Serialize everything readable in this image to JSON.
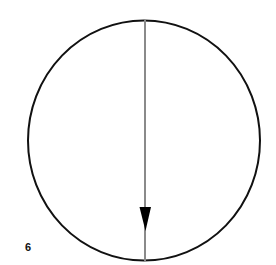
{
  "diagram": {
    "label": "6",
    "circle": {
      "cx": 144,
      "cy": 140.5,
      "rx": 116,
      "ry": 120,
      "stroke": "#111111",
      "stroke_width": 2
    },
    "vector": {
      "x": 145,
      "y_start": 20,
      "y_end": 261,
      "arrow_tip_y": 230,
      "color": "#888888",
      "direction": "down",
      "arrowhead_color": "#000000"
    }
  }
}
